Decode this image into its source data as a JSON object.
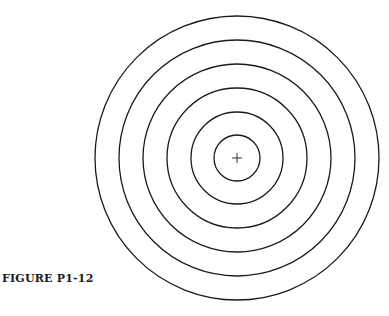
{
  "figure": {
    "caption": "FIGURE P1-12",
    "center": {
      "x": 237,
      "y": 158
    },
    "ring_radii": [
      23,
      46,
      70,
      94,
      118,
      142
    ],
    "crosshair_size": 10,
    "stroke_color": "#1a1a1a",
    "background_color": "#ffffff"
  }
}
